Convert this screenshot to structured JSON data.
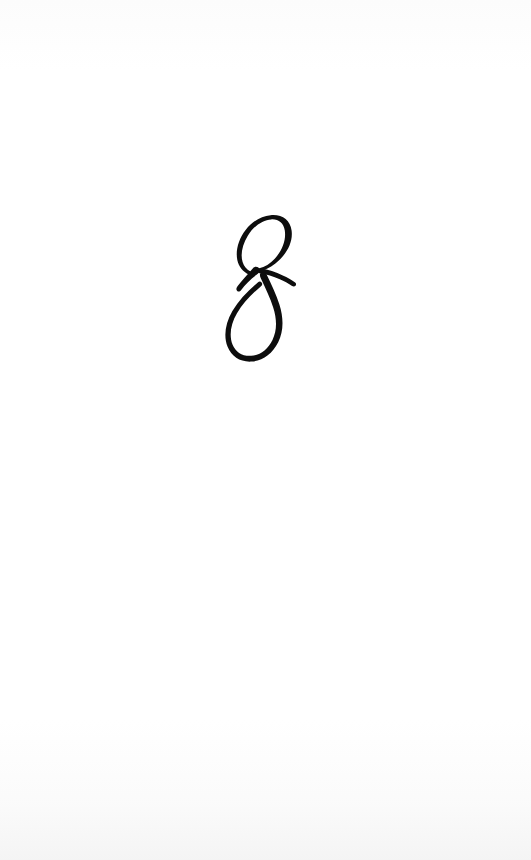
{
  "page": {
    "kind": "book-chapter-opener",
    "background_color": "#ffffff",
    "width": 531,
    "height": 860
  },
  "chapter": {
    "number": "8",
    "numeral_style": "italic-script-didone",
    "ink_color": "#0d0d0d",
    "glyph_name": "numeral-eight-ornamental",
    "position": {
      "left": 216,
      "top": 218,
      "right": 297,
      "bottom": 372,
      "center_x": 256
    }
  },
  "body": {
    "text": "",
    "note": ""
  },
  "footer": {
    "page_number": ""
  }
}
